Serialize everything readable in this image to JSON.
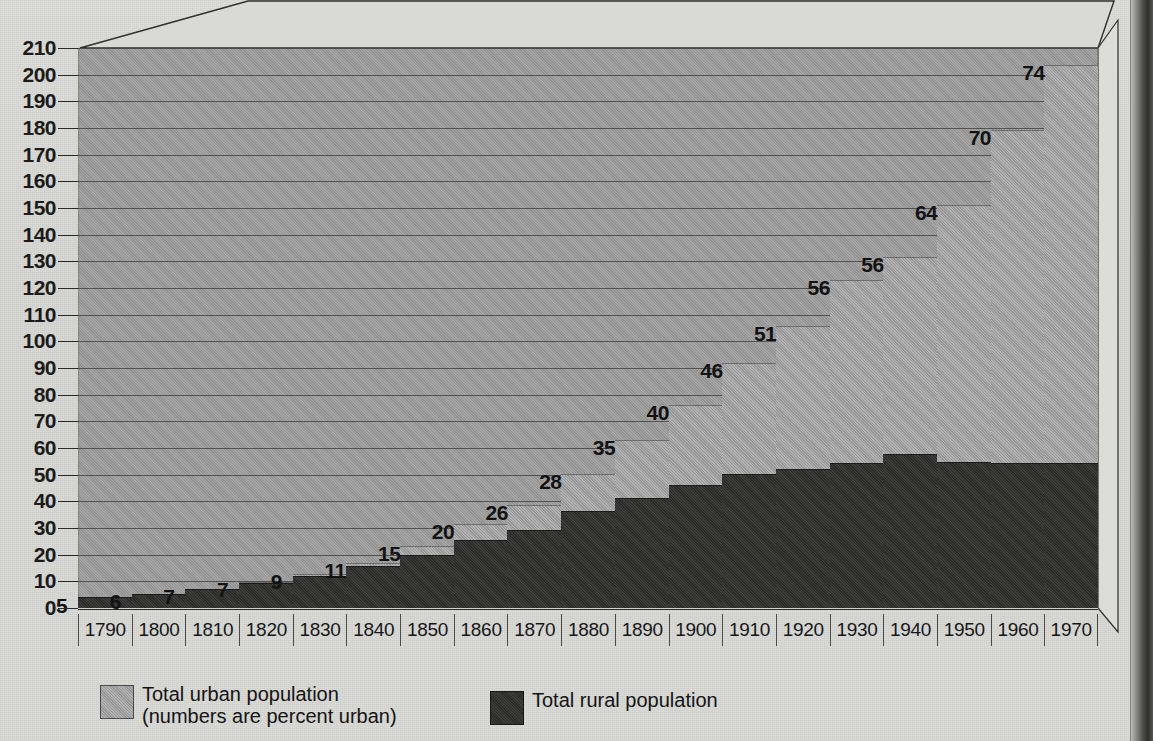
{
  "chart_data": {
    "type": "bar",
    "title": "",
    "subtitle": "",
    "xlabel": "",
    "ylabel": "",
    "ylim": [
      0,
      210
    ],
    "ytick_step": 10,
    "yticks": [
      210,
      200,
      190,
      180,
      170,
      160,
      150,
      140,
      130,
      120,
      110,
      100,
      90,
      80,
      70,
      60,
      50,
      40,
      30,
      20,
      10,
      0
    ],
    "grid": true,
    "stacked": true,
    "legend_position": "bottom-left",
    "categories": [
      "1790",
      "1800",
      "1810",
      "1820",
      "1830",
      "1840",
      "1850",
      "1860",
      "1870",
      "1880",
      "1890",
      "1900",
      "1910",
      "1920",
      "1930",
      "1940",
      "1950",
      "1960",
      "1970"
    ],
    "series": [
      {
        "name": "Total rural population",
        "color": "#333331",
        "values": [
          3.7,
          5.0,
          6.7,
          8.9,
          11.7,
          15.2,
          19.6,
          25.2,
          28.7,
          36.0,
          40.8,
          45.8,
          50.0,
          51.6,
          54.0,
          57.2,
          54.5,
          54.0,
          53.9
        ]
      },
      {
        "name": "Total urban population (numbers are percent urban)",
        "color": "#a2a2a2",
        "values": [
          0.2,
          0.3,
          0.5,
          0.7,
          1.1,
          1.8,
          3.5,
          6.2,
          9.9,
          14.1,
          22.1,
          30.2,
          42.0,
          54.2,
          69.0,
          74.4,
          96.5,
          125.3,
          149.6
        ]
      }
    ],
    "totals": [
      3.9,
      5.3,
      7.2,
      9.6,
      12.8,
      17.0,
      23.1,
      31.4,
      38.6,
      50.1,
      62.9,
      76.0,
      92.0,
      105.8,
      123.0,
      131.6,
      151.0,
      179.3,
      203.5
    ],
    "data_labels": [
      "5",
      "6",
      "7",
      "7",
      "9",
      "11",
      "15",
      "20",
      "26",
      "28",
      "35",
      "40",
      "46",
      "51",
      "56",
      "56",
      "64",
      "70",
      "74"
    ],
    "data_label_note": "numbers are percent urban"
  },
  "legend": {
    "urban": {
      "line1": "Total urban population",
      "line2": "(numbers are percent urban)"
    },
    "rural": {
      "line1": "Total rural population"
    }
  }
}
